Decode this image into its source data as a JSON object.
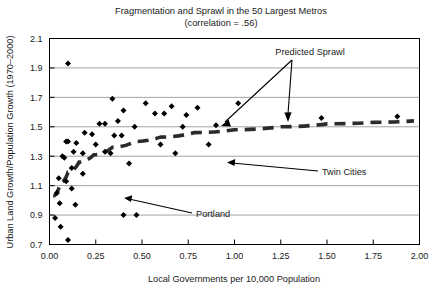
{
  "chart_data": {
    "type": "scatter",
    "title": "Fragmentation and Sprawl in the 50 Largest Metros",
    "subtitle": "(correlation = .56)",
    "xlabel": "Local Governments per 10,000 Population",
    "ylabel": "Urban Land Growth/Population Growth (1970–2000)",
    "xlim": [
      0.0,
      2.0
    ],
    "ylim": [
      0.7,
      2.1
    ],
    "xticks": [
      0.0,
      0.25,
      0.5,
      0.75,
      1.0,
      1.25,
      1.5,
      1.75,
      2.0
    ],
    "xticklabels": [
      "0.00",
      "0.25",
      "0.50",
      "0.75",
      "1.00",
      "1.25",
      "1.50",
      "1.75",
      "2.00"
    ],
    "yticks": [
      0.7,
      0.9,
      1.1,
      1.3,
      1.5,
      1.7,
      1.9,
      2.1
    ],
    "yticklabels": [
      "0.7",
      "0.9",
      "1.1",
      "1.3",
      "1.5",
      "1.7",
      "1.9",
      "2.1"
    ],
    "grid": "horizontal",
    "legend": "none",
    "marker": "diamond",
    "marker_color": "#000000",
    "points": [
      {
        "x": 0.1,
        "y": 1.93
      },
      {
        "x": 0.34,
        "y": 1.69
      },
      {
        "x": 0.4,
        "y": 1.61
      },
      {
        "x": 0.52,
        "y": 1.66
      },
      {
        "x": 0.57,
        "y": 1.59
      },
      {
        "x": 0.62,
        "y": 1.59
      },
      {
        "x": 0.66,
        "y": 1.64
      },
      {
        "x": 0.74,
        "y": 1.58
      },
      {
        "x": 0.8,
        "y": 1.63
      },
      {
        "x": 1.02,
        "y": 1.66
      },
      {
        "x": 1.47,
        "y": 1.56
      },
      {
        "x": 1.88,
        "y": 1.57
      },
      {
        "x": 0.27,
        "y": 1.52
      },
      {
        "x": 0.3,
        "y": 1.52
      },
      {
        "x": 0.37,
        "y": 1.54
      },
      {
        "x": 0.46,
        "y": 1.5
      },
      {
        "x": 0.72,
        "y": 1.5
      },
      {
        "x": 0.9,
        "y": 1.51
      },
      {
        "x": 0.19,
        "y": 1.46
      },
      {
        "x": 0.23,
        "y": 1.45
      },
      {
        "x": 0.35,
        "y": 1.44
      },
      {
        "x": 0.39,
        "y": 1.44
      },
      {
        "x": 0.09,
        "y": 1.4
      },
      {
        "x": 0.1,
        "y": 1.4
      },
      {
        "x": 0.145,
        "y": 1.39
      },
      {
        "x": 0.25,
        "y": 1.38
      },
      {
        "x": 0.6,
        "y": 1.38
      },
      {
        "x": 0.86,
        "y": 1.38
      },
      {
        "x": 0.13,
        "y": 1.33
      },
      {
        "x": 0.18,
        "y": 1.32
      },
      {
        "x": 0.3,
        "y": 1.33
      },
      {
        "x": 0.33,
        "y": 1.32
      },
      {
        "x": 0.43,
        "y": 1.25
      },
      {
        "x": 0.68,
        "y": 1.32
      },
      {
        "x": 0.07,
        "y": 1.3
      },
      {
        "x": 0.08,
        "y": 1.29
      },
      {
        "x": 0.12,
        "y": 1.22
      },
      {
        "x": 0.18,
        "y": 1.18
      },
      {
        "x": 0.05,
        "y": 1.15
      },
      {
        "x": 0.09,
        "y": 1.13
      },
      {
        "x": 0.12,
        "y": 1.08
      },
      {
        "x": 0.04,
        "y": 1.05
      },
      {
        "x": 0.055,
        "y": 0.98
      },
      {
        "x": 0.14,
        "y": 0.97
      },
      {
        "x": 0.4,
        "y": 0.9
      },
      {
        "x": 0.47,
        "y": 0.9
      },
      {
        "x": 0.03,
        "y": 0.88
      },
      {
        "x": 0.06,
        "y": 0.82
      },
      {
        "x": 0.1,
        "y": 0.73
      }
    ],
    "trend_line": {
      "name": "Predicted Sprawl",
      "style": "dashed",
      "points": [
        {
          "x": 0.02,
          "y": 1.03
        },
        {
          "x": 0.06,
          "y": 1.12
        },
        {
          "x": 0.1,
          "y": 1.19
        },
        {
          "x": 0.16,
          "y": 1.26
        },
        {
          "x": 0.24,
          "y": 1.31
        },
        {
          "x": 0.34,
          "y": 1.36
        },
        {
          "x": 0.46,
          "y": 1.4
        },
        {
          "x": 0.6,
          "y": 1.43
        },
        {
          "x": 0.78,
          "y": 1.46
        },
        {
          "x": 1.0,
          "y": 1.48
        },
        {
          "x": 1.25,
          "y": 1.5
        },
        {
          "x": 1.5,
          "y": 1.52
        },
        {
          "x": 1.75,
          "y": 1.53
        },
        {
          "x": 1.97,
          "y": 1.54
        }
      ]
    },
    "annotations": [
      {
        "label": "Predicted Sprawl",
        "target_x": 1.47,
        "target_y": 1.45,
        "kind": "curve-callout"
      },
      {
        "label": "Twin Cities",
        "target_x": 0.95,
        "target_y": 1.3,
        "kind": "point-callout"
      },
      {
        "label": "Portland",
        "target_x": 0.4,
        "target_y": 0.9,
        "kind": "point-callout"
      }
    ]
  }
}
